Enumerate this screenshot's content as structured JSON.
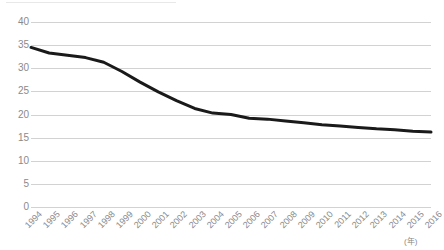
{
  "chart_data": {
    "type": "line",
    "title": "",
    "xlabel": "(年)",
    "ylabel": "",
    "ylim": [
      0,
      40
    ],
    "ytick_step": 5,
    "yticks": [
      40,
      35,
      30,
      25,
      20,
      15,
      10,
      5,
      0
    ],
    "grid": true,
    "legend": "none",
    "line_color": "#1a1a1a",
    "line_width_px": 3,
    "gridline_color": "#d2d2d2",
    "tick_label_color": "#8a8a8a",
    "categories": [
      "1994",
      "1995",
      "1996",
      "1997",
      "1998",
      "1999",
      "2000",
      "2001",
      "2002",
      "2003",
      "2004",
      "2005",
      "2006",
      "2007",
      "2008",
      "2009",
      "2010",
      "2011",
      "2012",
      "2013",
      "2014",
      "2015",
      "2016"
    ],
    "values": [
      34.5,
      33.3,
      32.8,
      32.3,
      31.3,
      29.3,
      27.0,
      24.9,
      23.0,
      21.3,
      20.3,
      20.0,
      19.2,
      19.0,
      18.6,
      18.2,
      17.8,
      17.5,
      17.2,
      16.9,
      16.7,
      16.4,
      16.2
    ],
    "series": [
      {
        "name": "",
        "values": [
          34.5,
          33.3,
          32.8,
          32.3,
          31.3,
          29.3,
          27.0,
          24.9,
          23.0,
          21.3,
          20.3,
          20.0,
          19.2,
          19.0,
          18.6,
          18.2,
          17.8,
          17.5,
          17.2,
          16.9,
          16.7,
          16.4,
          16.2
        ]
      }
    ]
  }
}
